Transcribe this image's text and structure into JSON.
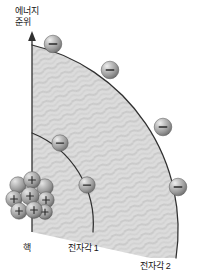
{
  "figure": {
    "kind": "atomic-shell-energy-level-diagram",
    "background_color": "#ffffff",
    "line_color": "#2b2b2b",
    "shade_fill": "#d8d8d8",
    "sphere_color": "#9a9a9a",
    "sphere_highlight": "#e8e8e8"
  },
  "labels": {
    "energy_axis_line1": "에너지",
    "energy_axis_line2": "준위",
    "nucleus": "핵",
    "shell1": "전자각 1",
    "shell2": "전자각 2"
  },
  "axis": {
    "name": "energy-level-axis",
    "orientation": "vertical",
    "arrow_direction": "up",
    "x": 32,
    "y_top": 33,
    "y_bottom": 232
  },
  "nucleus": {
    "name": "nucleus-cluster",
    "center_x": 31,
    "center_y": 197,
    "proton_count_visible": 9,
    "charge_symbol": "+",
    "spheres": [
      {
        "cx": 18,
        "cy": 185,
        "r": 8,
        "charge": ""
      },
      {
        "cx": 32,
        "cy": 180,
        "r": 8,
        "charge": "+"
      },
      {
        "cx": 45,
        "cy": 187,
        "r": 8,
        "charge": ""
      },
      {
        "cx": 14,
        "cy": 198,
        "r": 8,
        "charge": "+"
      },
      {
        "cx": 29,
        "cy": 195,
        "r": 9,
        "charge": ""
      },
      {
        "cx": 45,
        "cy": 199,
        "r": 8,
        "charge": "+"
      },
      {
        "cx": 19,
        "cy": 210,
        "r": 8,
        "charge": "+"
      },
      {
        "cx": 34,
        "cy": 209,
        "r": 8,
        "charge": "+"
      },
      {
        "cx": 45,
        "cy": 212,
        "r": 7,
        "charge": "+"
      }
    ]
  },
  "shells": [
    {
      "name": "electron-shell-1",
      "label": "전자각 1",
      "radius": 98,
      "arc_start": {
        "x": 32,
        "y": 133
      },
      "arc_end": {
        "x": 93,
        "y": 232
      },
      "electron_count": 2,
      "electrons": [
        {
          "cx": 60,
          "cy": 143,
          "r": 8,
          "charge": "−"
        },
        {
          "cx": 87,
          "cy": 185,
          "r": 8,
          "charge": "−"
        }
      ]
    },
    {
      "name": "electron-shell-2",
      "label": "전자각 2",
      "radius": 190,
      "arc_start": {
        "x": 32,
        "y": 45
      },
      "arc_end": {
        "x": 176,
        "y": 258
      },
      "electron_count": 4,
      "electrons": [
        {
          "cx": 53,
          "cy": 44,
          "r": 9,
          "charge": "−"
        },
        {
          "cx": 110,
          "cy": 70,
          "r": 9,
          "charge": "−"
        },
        {
          "cx": 163,
          "cy": 127,
          "r": 9,
          "charge": "−"
        },
        {
          "cx": 178,
          "cy": 187,
          "r": 9,
          "charge": "−"
        }
      ]
    }
  ],
  "electron_symbol": "−",
  "proton_symbol": "+"
}
